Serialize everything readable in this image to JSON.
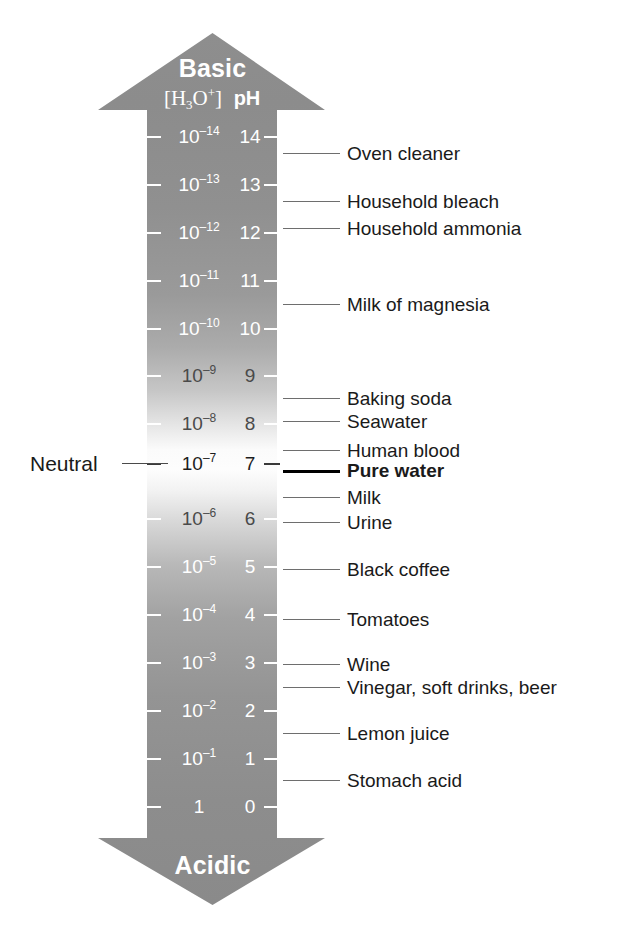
{
  "axis": {
    "top_caption": "Basic",
    "bottom_caption": "Acidic",
    "header_concentration": "[H3O+]",
    "header_ph": "pH",
    "neutral_label": "Neutral"
  },
  "colors": {
    "arrow_gray": "#8a8a8a",
    "arrow_light": "#fbfbfb",
    "scale_text_light": "#ffffff",
    "scale_text_dark": "#1d1d1d",
    "leader_line": "#6e6e6e",
    "leader_line_emphasis": "#000000",
    "label_text": "#1a1a1a"
  },
  "chart_data": {
    "type": "bar",
    "xlabel": "",
    "ylabel": "pH",
    "ylim": [
      0,
      14
    ],
    "grid": false,
    "legend": null,
    "orientation": "vertical",
    "categories": [
      "14",
      "13",
      "12",
      "11",
      "10",
      "9",
      "8",
      "7",
      "6",
      "5",
      "4",
      "3",
      "2",
      "1",
      "0"
    ],
    "values": [
      14,
      13,
      12,
      11,
      10,
      9,
      8,
      7,
      6,
      5,
      4,
      3,
      2,
      1,
      0
    ],
    "series": [
      {
        "name": "[H3O+] concentration (mol/L)",
        "values": [
          "10^-14",
          "10^-13",
          "10^-12",
          "10^-11",
          "10^-10",
          "10^-9",
          "10^-8",
          "10^-7",
          "10^-6",
          "10^-5",
          "10^-4",
          "10^-3",
          "10^-2",
          "10^-1",
          "1"
        ]
      }
    ],
    "annotations": [
      {
        "label": "Oven cleaner",
        "ph": 13.6
      },
      {
        "label": "Household bleach",
        "ph": 12.6
      },
      {
        "label": "Household ammonia",
        "ph": 12.2
      },
      {
        "label": "Milk of magnesia",
        "ph": 10.5
      },
      {
        "label": "Baking soda",
        "ph": 8.6
      },
      {
        "label": "Seawater",
        "ph": 8.2
      },
      {
        "label": "Human blood",
        "ph": 7.4
      },
      {
        "label": "Pure water",
        "ph": 7.0,
        "emphasis": true
      },
      {
        "label": "Milk",
        "ph": 6.6
      },
      {
        "label": "Urine",
        "ph": 6.0
      },
      {
        "label": "Black coffee",
        "ph": 5.0
      },
      {
        "label": "Tomatoes",
        "ph": 4.1
      },
      {
        "label": "Wine",
        "ph": 3.3
      },
      {
        "label": "Vinegar, soft drinks, beer",
        "ph": 2.9
      },
      {
        "label": "Lemon juice",
        "ph": 2.1
      },
      {
        "label": "Stomach acid",
        "ph": 1.3
      }
    ]
  },
  "scale_rows": [
    {
      "ph": "14",
      "conc_mantissa": "10",
      "conc_exp": "–14",
      "y": 136,
      "tone": "dark"
    },
    {
      "ph": "13",
      "conc_mantissa": "10",
      "conc_exp": "–13",
      "y": 184,
      "tone": "dark"
    },
    {
      "ph": "12",
      "conc_mantissa": "10",
      "conc_exp": "–12",
      "y": 232,
      "tone": "dark"
    },
    {
      "ph": "11",
      "conc_mantissa": "10",
      "conc_exp": "–11",
      "y": 280,
      "tone": "dark"
    },
    {
      "ph": "10",
      "conc_mantissa": "10",
      "conc_exp": "–10",
      "y": 328,
      "tone": "dark"
    },
    {
      "ph": "9",
      "conc_mantissa": "10",
      "conc_exp": "–9",
      "y": 375,
      "tone": "mid"
    },
    {
      "ph": "8",
      "conc_mantissa": "10",
      "conc_exp": "–8",
      "y": 423,
      "tone": "mid"
    },
    {
      "ph": "7",
      "conc_mantissa": "10",
      "conc_exp": "–7",
      "y": 463,
      "tone": "light"
    },
    {
      "ph": "6",
      "conc_mantissa": "10",
      "conc_exp": "–6",
      "y": 518,
      "tone": "mid"
    },
    {
      "ph": "5",
      "conc_mantissa": "10",
      "conc_exp": "–5",
      "y": 566,
      "tone": "dark"
    },
    {
      "ph": "4",
      "conc_mantissa": "10",
      "conc_exp": "–4",
      "y": 614,
      "tone": "dark"
    },
    {
      "ph": "3",
      "conc_mantissa": "10",
      "conc_exp": "–3",
      "y": 662,
      "tone": "dark"
    },
    {
      "ph": "2",
      "conc_mantissa": "10",
      "conc_exp": "–2",
      "y": 710,
      "tone": "dark"
    },
    {
      "ph": "1",
      "conc_mantissa": "10",
      "conc_exp": "–1",
      "y": 758,
      "tone": "dark"
    },
    {
      "ph": "0",
      "conc_mantissa": "1",
      "conc_exp": "",
      "y": 806,
      "tone": "dark"
    }
  ],
  "callouts": [
    {
      "label": "Oven cleaner",
      "y": 153,
      "emphasis": false
    },
    {
      "label": "Household bleach",
      "y": 201,
      "emphasis": false
    },
    {
      "label": "Household ammonia",
      "y": 228,
      "emphasis": false
    },
    {
      "label": "Milk of magnesia",
      "y": 304,
      "emphasis": false
    },
    {
      "label": "Baking soda",
      "y": 398,
      "emphasis": false
    },
    {
      "label": "Seawater",
      "y": 421,
      "emphasis": false
    },
    {
      "label": "Human blood",
      "y": 450,
      "emphasis": false
    },
    {
      "label": "Pure water",
      "y": 470,
      "emphasis": true
    },
    {
      "label": "Milk",
      "y": 497,
      "emphasis": false
    },
    {
      "label": "Urine",
      "y": 522,
      "emphasis": false
    },
    {
      "label": "Black coffee",
      "y": 569,
      "emphasis": false
    },
    {
      "label": "Tomatoes",
      "y": 619,
      "emphasis": false
    },
    {
      "label": "Wine",
      "y": 664,
      "emphasis": false
    },
    {
      "label": "Vinegar, soft drinks, beer",
      "y": 687,
      "emphasis": false
    },
    {
      "label": "Lemon juice",
      "y": 733,
      "emphasis": false
    },
    {
      "label": "Stomach acid",
      "y": 780,
      "emphasis": false
    }
  ],
  "neutral_marker": {
    "label": "Neutral",
    "y": 463
  }
}
